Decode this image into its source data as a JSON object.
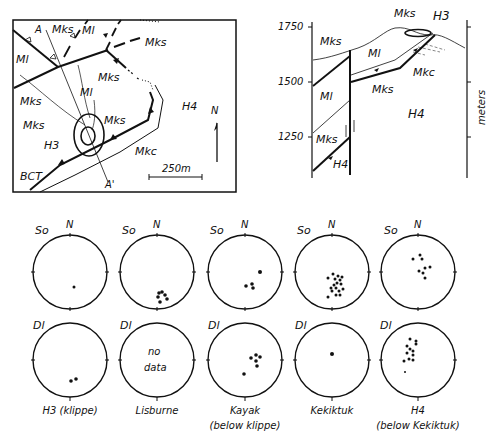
{
  "map": {
    "labels": [
      "A",
      "A'",
      "Mks",
      "Ml",
      "Mks",
      "Ml",
      "Mks",
      "Mks",
      "Ml",
      "Mks",
      "H3",
      "Mkc",
      "H4",
      "BCT",
      "N"
    ],
    "section_start": "A",
    "section_end": "A'",
    "scale_label": "250m",
    "north_label": "N",
    "units": {
      "mks_1": "Mks",
      "ml_1": "Ml",
      "mks_2": "Mks",
      "ml_2": "Ml",
      "mks_3": "Mks",
      "mks_4": "Mks",
      "ml_3": "Ml",
      "mks_5": "Mks",
      "h3": "H3",
      "mkc": "Mkc",
      "h4": "H4",
      "bct": "BCT"
    }
  },
  "section": {
    "elevations": [
      "1750",
      "1500",
      "1250"
    ],
    "axis_label": "meters",
    "units": {
      "mks_top": "Mks",
      "h3": "H3",
      "mks_left": "Mks",
      "ml_mid": "Ml",
      "mkc": "Mkc",
      "mks_low": "Mks",
      "ml_left": "Ml",
      "h4": "H4",
      "mks_bottom": "Mks",
      "h4_bottom": "H4"
    }
  },
  "stereonets": {
    "row_labels": {
      "top": "So",
      "bottom": "Dl"
    },
    "north_label": "N",
    "columns": [
      {
        "name": "H3 (klippe)",
        "line1": "H3 (klippe)",
        "line2": ""
      },
      {
        "name": "Lisburne",
        "line1": "Lisburne",
        "line2": "",
        "no_data_1": "no",
        "no_data_2": "data"
      },
      {
        "name": "Kayak",
        "line1": "Kayak",
        "line2": "(below klippe)"
      },
      {
        "name": "Kekiktuk",
        "line1": "Kekiktuk",
        "line2": ""
      },
      {
        "name": "H4",
        "line1": "H4",
        "line2": "(below Kekiktuk)"
      }
    ]
  }
}
